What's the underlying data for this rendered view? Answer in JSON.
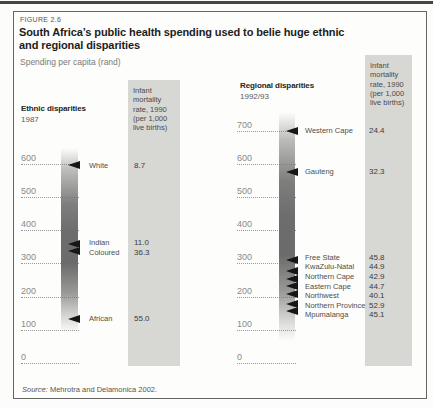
{
  "page": {
    "figure_label": "FIGURE 2.6",
    "title_line1": "South Africa’s public health spending used to belie huge ethnic",
    "title_line2": "and regional disparities",
    "subtitle": "Spending per capita (rand)",
    "source_prefix": "Source:",
    "source_rest": " Mehrotra and Delamonica 2002."
  },
  "colors": {
    "imr_box_bg": "#d7d7d4",
    "bar_gray": "#6d6d6d",
    "arrow_black": "#161616",
    "tick_gray": "#8a8a8a",
    "border_gray": "#646464"
  },
  "chart_data": {
    "type": "scatter",
    "title": "South Africa’s public health spending used to belie huge ethnic and regional disparities",
    "ylabel": "Spending per capita (rand)",
    "grid": "dotted horizontal gridlines at each 100 rand",
    "legend_position": "none",
    "imr_header": "Infant\nmortality\nrate, 1990\n(per 1,000\nlive births)",
    "charts": [
      {
        "id": "ethnic",
        "heading": "Ethnic disparities",
        "year": "1987",
        "axis": {
          "min": 0,
          "max": 600,
          "step": 100
        },
        "bar_range_rand": [
          90,
          648
        ],
        "markers": [
          {
            "label": "White",
            "spending_rand": 595,
            "infant_mortality": "8.7"
          },
          {
            "label": "Indian",
            "spending_rand": 358,
            "infant_mortality": "11.0"
          },
          {
            "label": "Coloured",
            "spending_rand": 337,
            "infant_mortality": "36.3"
          },
          {
            "label": "African",
            "spending_rand": 134,
            "infant_mortality": "55.0"
          }
        ]
      },
      {
        "id": "regional",
        "heading": "Regional disparities",
        "year": "1992/93",
        "axis": {
          "min": 0,
          "max": 700,
          "step": 100
        },
        "bar_range_rand": [
          66,
          755
        ],
        "markers": [
          {
            "label": "Western Cape",
            "spending_rand": 700,
            "infant_mortality": "24.4"
          },
          {
            "label": "Gauteng",
            "spending_rand": 575,
            "infant_mortality": "32.3"
          },
          {
            "label": "Free State",
            "spending_rand": 310,
            "infant_mortality": "45.8"
          },
          {
            "label": "KwaZulu-Natal",
            "spending_rand": 277,
            "infant_mortality": "44.9"
          },
          {
            "label": "Northern Cape",
            "spending_rand": 254,
            "infant_mortality": "42.9"
          },
          {
            "label": "Eastern Cape",
            "spending_rand": 232,
            "infant_mortality": "44.7"
          },
          {
            "label": "Northwest",
            "spending_rand": 208,
            "infant_mortality": "40.1"
          },
          {
            "label": "Northern Province",
            "spending_rand": 178,
            "infant_mortality": "52.9"
          },
          {
            "label": "Mpumalanga",
            "spending_rand": 157,
            "infant_mortality": "45.1"
          }
        ]
      }
    ]
  }
}
